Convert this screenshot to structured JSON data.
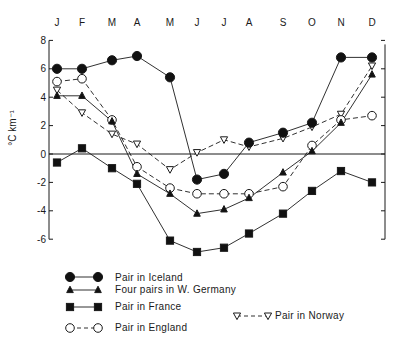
{
  "chart_data": {
    "type": "line",
    "title": "",
    "xlabel": "",
    "ylabel": "°C km⁻¹",
    "ylim": [
      -6,
      8
    ],
    "yticks": [
      8,
      6,
      4,
      2,
      0,
      -2,
      -4,
      -6
    ],
    "grid": false,
    "zero_line": true,
    "legend_position": "below",
    "categories": [
      "J",
      "F",
      "M",
      "A",
      "M",
      "J",
      "J",
      "A",
      "S",
      "O",
      "N",
      "D"
    ],
    "series": [
      {
        "name": "Pair in Iceland",
        "marker": "filled-circle",
        "line": "solid",
        "values": [
          6.0,
          6.0,
          6.6,
          6.9,
          5.4,
          -1.8,
          -1.4,
          0.8,
          1.5,
          2.2,
          6.8,
          6.8
        ]
      },
      {
        "name": "Four pairs in W. Germany",
        "marker": "filled-triangle",
        "line": "solid",
        "values": [
          4.1,
          4.1,
          2.3,
          -1.4,
          -2.8,
          -4.2,
          -3.9,
          -3.1,
          -1.3,
          0.2,
          2.2,
          5.6
        ]
      },
      {
        "name": "Pair in France",
        "marker": "filled-square",
        "line": "solid",
        "values": [
          -0.6,
          0.4,
          -1.0,
          -2.1,
          -6.1,
          -6.9,
          -6.6,
          -5.6,
          -4.2,
          -2.6,
          -1.2,
          -2.0
        ]
      },
      {
        "name": "Pair in England",
        "marker": "open-circle",
        "line": "dashed",
        "values": [
          5.1,
          5.3,
          2.4,
          -0.9,
          -2.4,
          -2.8,
          -2.8,
          -2.8,
          -2.3,
          0.6,
          2.4,
          2.7
        ]
      },
      {
        "name": "Pair in Norway",
        "marker": "open-triangle-down",
        "line": "dashed",
        "values": [
          4.5,
          2.9,
          1.4,
          0.7,
          -1.1,
          0.1,
          1.0,
          0.5,
          1.1,
          1.9,
          2.8,
          6.2
        ]
      }
    ]
  },
  "legend": {
    "iceland": "Pair in Iceland",
    "germany": "Four pairs in W. Germany",
    "france": "Pair in France",
    "england": "Pair in England",
    "norway": "Pair in Norway"
  },
  "axis": {
    "ylabel": "°C km⁻¹"
  }
}
